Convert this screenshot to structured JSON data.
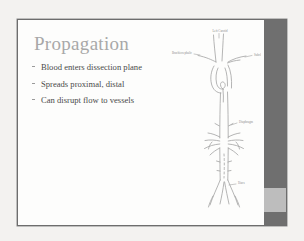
{
  "slide": {
    "title": "Propagation",
    "bullets": [
      {
        "text": "Blood enters dissection plane"
      },
      {
        "text": "Spreads proximal, distal"
      },
      {
        "text": "Can disrupt flow to vessels"
      }
    ],
    "diagram": {
      "name": "aorta-dissection-diagram",
      "labels": [
        {
          "id": "left-carotid",
          "text": "Left Carotid"
        },
        {
          "id": "brachiocephalic",
          "text": "Brachiocephalic"
        },
        {
          "id": "subclavian",
          "text": "Subclavian"
        },
        {
          "id": "diaphragm",
          "text": "Diaphragm"
        },
        {
          "id": "iliacs",
          "text": "Iliacs"
        }
      ]
    },
    "colors": {
      "page_background": "#f3f2f0",
      "slide_background": "#fdfdfc",
      "slide_border": "#6d6d6d",
      "title_text": "#a8a8a8",
      "body_text": "#4a4a4a",
      "sidebar_dark": "#6f6f6f",
      "sidebar_light": "#bdbdbd",
      "diagram_line": "#a0a0a0",
      "label_text": "#8e8e8e"
    }
  }
}
